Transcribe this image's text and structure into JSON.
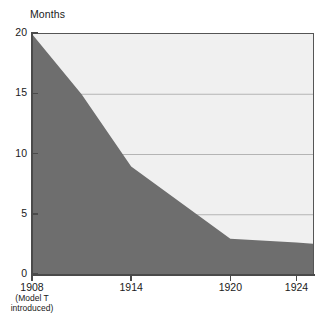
{
  "chart_data": {
    "type": "area",
    "title": "",
    "subtitle": "",
    "xlabel": "",
    "ylabel": "Months",
    "x": [
      1908,
      1911,
      1914,
      1920,
      1924,
      1925
    ],
    "values": [
      20,
      15,
      9,
      3,
      2.7,
      2.6
    ],
    "series": [
      {
        "name": "Months",
        "values": [
          20,
          15,
          9,
          3,
          2.7,
          2.6
        ]
      }
    ],
    "xlim": [
      1908,
      1925
    ],
    "ylim": [
      0,
      20
    ],
    "grid": true,
    "legend": null,
    "legend_position": "none",
    "annotations": [
      {
        "target": "1908",
        "line1": "(Model T",
        "line2": "introduced)"
      }
    ],
    "y_ticks": [
      {
        "value": 20,
        "label": "20"
      },
      {
        "value": 15,
        "label": "15"
      },
      {
        "value": 10,
        "label": "10"
      },
      {
        "value": 5,
        "label": "5"
      },
      {
        "value": 0,
        "label": "0"
      }
    ],
    "x_ticks": [
      {
        "value": 1908,
        "label": "1908"
      },
      {
        "value": 1914,
        "label": "1914"
      },
      {
        "value": 1920,
        "label": "1920"
      },
      {
        "value": 1924,
        "label": "1924"
      }
    ],
    "colors": {
      "area_fill": "#6e6e6e",
      "plot_background": "#f0f0f0",
      "gridline": "#b4b4b4",
      "axis": "#4a4a4a",
      "text": "#1a1a1a",
      "page_background": "#ffffff"
    }
  }
}
